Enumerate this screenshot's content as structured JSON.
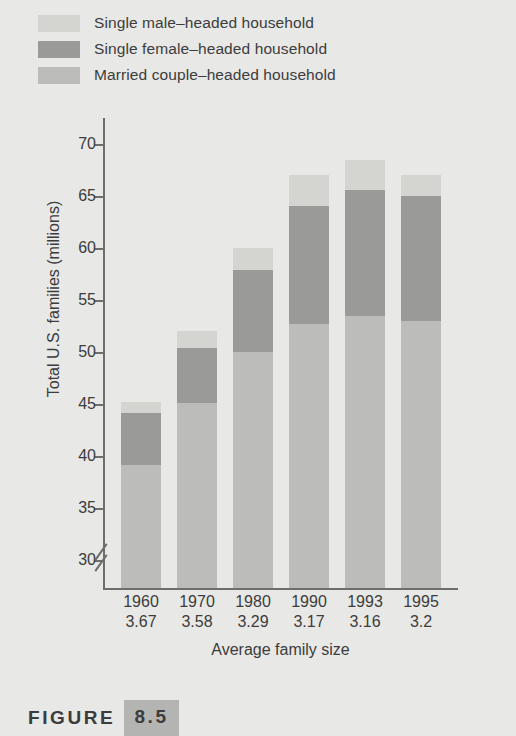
{
  "figure": {
    "word": "FIGURE",
    "number": "8.5"
  },
  "legend": {
    "position": "top-left",
    "items": [
      {
        "label": "Single male–headed household",
        "color": "#d4d4d1",
        "key": "single_male"
      },
      {
        "label": "Single female–headed household",
        "color": "#9a9a98",
        "key": "single_female"
      },
      {
        "label": "Married couple–headed household",
        "color": "#bcbcba",
        "key": "married_couple"
      }
    ]
  },
  "chart_data": {
    "type": "bar",
    "stacked": true,
    "title": "",
    "subtitle": "",
    "xlabel": "Average family size",
    "ylabel": "Total U.S. families (millions)",
    "categories": [
      "1960",
      "1970",
      "1980",
      "1990",
      "1993",
      "1995"
    ],
    "x_sublabels": [
      "3.67",
      "3.58",
      "3.29",
      "3.17",
      "3.16",
      "3.2"
    ],
    "x_sublabel_name": "Average family size",
    "ylim": [
      30,
      70
    ],
    "y_ticks": [
      30,
      35,
      40,
      45,
      50,
      55,
      60,
      65,
      70
    ],
    "y_axis_break": true,
    "y_axis_break_note": "axis broken below 30",
    "grid": false,
    "series": [
      {
        "name": "Married couple–headed household",
        "color": "#bcbcba",
        "values": [
          39.1,
          45.1,
          50.0,
          52.7,
          53.5,
          53.0
        ]
      },
      {
        "name": "Single female–headed household",
        "color": "#9a9a98",
        "values": [
          5.0,
          5.3,
          7.9,
          11.3,
          12.1,
          12.0
        ]
      },
      {
        "name": "Single male–headed household",
        "color": "#d4d4d1",
        "values": [
          1.1,
          1.6,
          2.1,
          3.0,
          2.9,
          2.0
        ]
      }
    ],
    "cumulative_tops": {
      "married_couple": [
        39.1,
        45.1,
        50.0,
        52.7,
        53.5,
        53.0
      ],
      "plus_single_female": [
        44.1,
        50.4,
        57.9,
        64.0,
        65.6,
        65.0
      ],
      "total": [
        45.2,
        52.0,
        60.0,
        67.0,
        68.5,
        67.0
      ]
    }
  },
  "colors": {
    "background": "#e8e8e6",
    "axis": "#6d6d6d",
    "text": "#3c3c3c",
    "married": "#bcbcba",
    "female": "#9a9a98",
    "male": "#d4d4d1",
    "caption_box": "#b4b4b2"
  }
}
